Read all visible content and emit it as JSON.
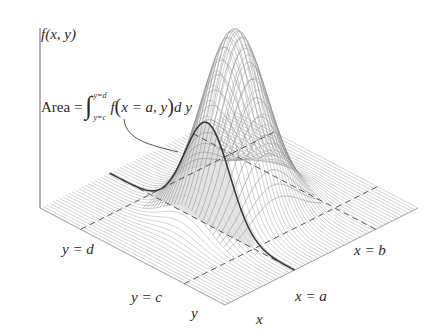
{
  "figure": {
    "colors": {
      "background": "#ffffff",
      "mesh_lines": "#9a9a9a",
      "base_lines": "#b0b0b0",
      "axis_line": "#555555",
      "highlight_curve": "#3a3a3a",
      "shaded_area": "#d8d8d8",
      "dashed_lines": "#555555",
      "text": "#2a2a2a"
    }
  },
  "labels": {
    "z_axis": "f(x, y)",
    "area_formula": {
      "prefix": "Area = ",
      "integral_sign": "∫",
      "upper_limit": "y=d",
      "lower_limit": "y=c",
      "integrand_f": "f",
      "open_paren": "(",
      "args": "x = a, y",
      "close_paren": ")",
      "differential": "d y"
    },
    "y_eq_d": "y = d",
    "y_eq_c": "y = c",
    "y_axis": "y",
    "x_axis": "x",
    "x_eq_a": "x = a",
    "x_eq_b": "x = b"
  },
  "geometry": {
    "axis_origin": [
      40,
      208
    ],
    "front_corner": [
      225,
      305
    ],
    "right_corner": [
      418,
      208
    ],
    "peak": [
      228,
      30
    ]
  }
}
